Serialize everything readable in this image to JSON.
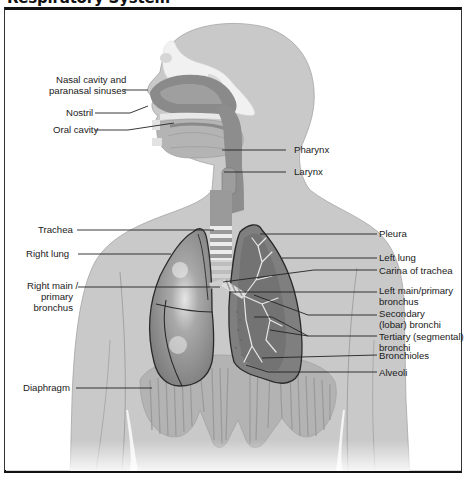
{
  "figure": {
    "title": "Respiratory System"
  },
  "labels": {
    "left": [
      {
        "id": "nasal",
        "line1": "Nasal cavity and",
        "line2": "paranasal sinuses"
      },
      {
        "id": "nostril",
        "text": "Nostril"
      },
      {
        "id": "oral",
        "text": "Oral cavity"
      },
      {
        "id": "trachea",
        "text": "Trachea"
      },
      {
        "id": "right_lung",
        "text": "Right lung"
      },
      {
        "id": "right_bronchus",
        "line1": "Right main /",
        "line2": "primary",
        "line3": "bronchus"
      },
      {
        "id": "diaphragm",
        "text": "Diaphragm"
      }
    ],
    "right": [
      {
        "id": "pharynx",
        "text": "Pharynx"
      },
      {
        "id": "larynx",
        "text": "Larynx"
      },
      {
        "id": "pleura",
        "text": "Pleura"
      },
      {
        "id": "left_lung",
        "text": "Left lung"
      },
      {
        "id": "carina",
        "text": "Carina of trachea"
      },
      {
        "id": "left_bronchus",
        "line1": "Left main/primary",
        "line2": "bronchus"
      },
      {
        "id": "secondary",
        "line1": "Secondary",
        "line2": "(lobar) bronchi"
      },
      {
        "id": "tertiary",
        "line1": "Tertiary (segmental)",
        "line2": "bronchi"
      },
      {
        "id": "bronchioles",
        "text": "Bronchioles"
      },
      {
        "id": "alveoli",
        "text": "Alveoli"
      }
    ]
  },
  "colors": {
    "body": "#c8c8c8",
    "body_outline": "#9a9a9a",
    "airway": "#8e8e8e",
    "lung_right": "#8f8f8f",
    "lung_left": "#7d7d7d",
    "lung_outline": "#2a2a2a",
    "bone": "#ececec",
    "leader_line": "#222222"
  }
}
